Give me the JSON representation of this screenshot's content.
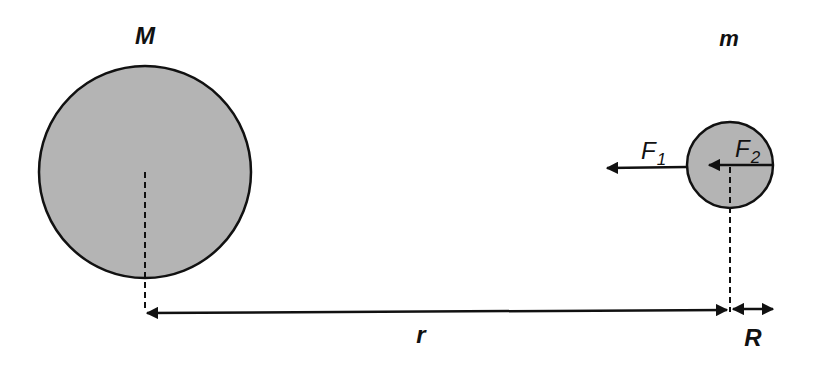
{
  "diagram": {
    "colors": {
      "body_fill": "#b4b4b4",
      "stroke": "#111111",
      "background": "#ffffff"
    },
    "bodies": [
      {
        "id": "large-mass",
        "label": "M",
        "cx": 145,
        "cy": 172,
        "r": 106
      },
      {
        "id": "small-mass",
        "label": "m",
        "cx": 730,
        "cy": 165,
        "r": 43
      }
    ],
    "forces": [
      {
        "id": "F1",
        "label": "F",
        "subscript": "1",
        "from_x": 687,
        "to_x": 606,
        "y": 167
      },
      {
        "id": "F2",
        "label": "F",
        "subscript": "2",
        "from_x": 773,
        "to_x": 708,
        "y": 165
      }
    ],
    "dimensions": [
      {
        "id": "r",
        "label": "r",
        "x1": 145,
        "x2": 729,
        "y": 312
      },
      {
        "id": "R",
        "label": "R",
        "x1": 731,
        "x2": 773,
        "y": 309
      }
    ]
  }
}
